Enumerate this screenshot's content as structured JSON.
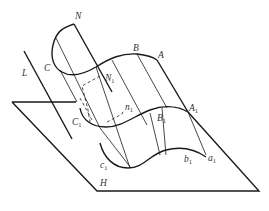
{
  "diagram": {
    "type": "cylindrical-surface-projection",
    "plane_label": "H",
    "direction_line_label": "L",
    "points": {
      "N": "N",
      "C": "C",
      "B": "B",
      "A": "A",
      "N1": {
        "base": "N",
        "sub": "1"
      },
      "n1": {
        "base": "n",
        "sub": "1"
      },
      "C1": {
        "base": "C",
        "sub": "1"
      },
      "B1": {
        "base": "B",
        "sub": "1"
      },
      "A1": {
        "base": "A",
        "sub": "1"
      },
      "c1": {
        "base": "c",
        "sub": "1"
      },
      "b1": {
        "base": "b",
        "sub": "1"
      },
      "a1": {
        "base": "a",
        "sub": "1"
      }
    },
    "colors": {
      "line": "#1a1a1a",
      "label": "#333333",
      "background": "#ffffff"
    }
  }
}
